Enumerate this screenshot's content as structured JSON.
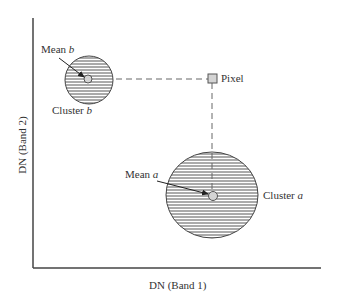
{
  "figure": {
    "x_axis_label": "DN (Band 1)",
    "y_axis_label": "DN (Band 2)",
    "colors": {
      "axis": "#444444",
      "ink": "#333333",
      "hatch": "#555555",
      "point_fill": "#d4d4d4",
      "dash": "#666666"
    }
  },
  "elements": {
    "cluster_b": {
      "label_text": "Cluster ",
      "label_var": "b",
      "cx": 89,
      "cy": 80,
      "r": 24
    },
    "mean_b": {
      "label_text": "Mean ",
      "label_var": "b",
      "cx": 88,
      "cy": 79,
      "r": 4
    },
    "cluster_a": {
      "label_text": "Cluster ",
      "label_var": "a",
      "cx": 212,
      "cy": 195,
      "rx": 46,
      "ry": 43
    },
    "mean_a": {
      "label_text": "Mean ",
      "label_var": "a",
      "cx": 213,
      "cy": 196,
      "r": 4.5
    },
    "pixel": {
      "label": "Pixel",
      "x": 208,
      "y": 74,
      "size": 9
    }
  }
}
